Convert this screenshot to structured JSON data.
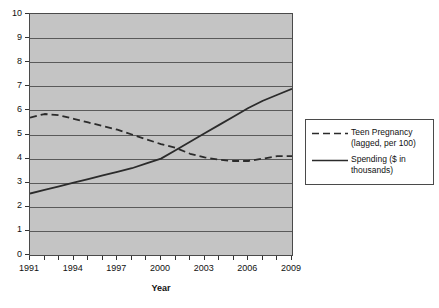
{
  "chart_data": {
    "type": "line",
    "title": "",
    "xlabel": "Year",
    "ylabel": "",
    "xlim": [
      1991,
      2009
    ],
    "ylim": [
      0,
      10
    ],
    "grid": true,
    "legend_position": "right",
    "x": [
      1991,
      1992,
      1993,
      1994,
      1995,
      1996,
      1997,
      1998,
      1999,
      2000,
      2001,
      2002,
      2003,
      2004,
      2005,
      2006,
      2007,
      2008,
      2009
    ],
    "y_ticks": [
      "0",
      "1",
      "2",
      "3",
      "4",
      "5",
      "6",
      "7",
      "8",
      "9",
      "10"
    ],
    "x_ticks": [
      "1991",
      "1994",
      "1997",
      "2000",
      "2003",
      "2006",
      "2009"
    ],
    "series": [
      {
        "name": "Teen Pregnancy (lagged, per 100)",
        "style": "dashed",
        "color": "#2b2b2b",
        "values": [
          5.7,
          5.85,
          5.8,
          5.65,
          5.5,
          5.35,
          5.2,
          5.0,
          4.8,
          4.6,
          4.45,
          4.2,
          4.05,
          3.95,
          3.9,
          3.9,
          4.0,
          4.1,
          4.1
        ]
      },
      {
        "name": "Spending ($ in thousands)",
        "style": "solid",
        "color": "#2b2b2b",
        "values": [
          2.55,
          2.7,
          2.85,
          3.0,
          3.15,
          3.3,
          3.45,
          3.6,
          3.8,
          4.0,
          4.35,
          4.7,
          5.05,
          5.4,
          5.75,
          6.1,
          6.4,
          6.65,
          6.9
        ]
      }
    ]
  },
  "legend": {
    "entries": [
      {
        "label": "Teen Pregnancy\n(lagged, per 100)",
        "style": "dashed"
      },
      {
        "label": "Spending ($ in\nthousands)",
        "style": "solid"
      }
    ]
  },
  "axis": {
    "x_title": "Year"
  },
  "colors": {
    "plot_background": "#c4c4c4",
    "gridline": "#5a5a5a",
    "frame": "#4a4a4a",
    "series": "#2b2b2b",
    "page_background": "#ffffff"
  }
}
